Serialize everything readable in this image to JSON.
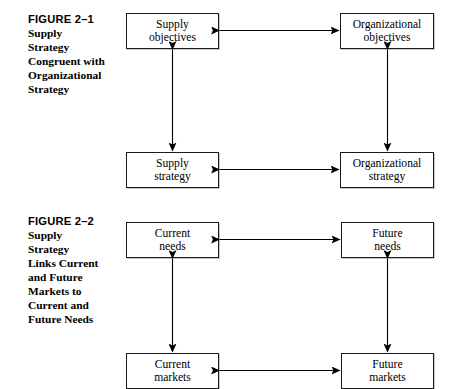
{
  "page": {
    "background": "#ffffff",
    "ink": "#000000",
    "width": 450,
    "height": 388
  },
  "figures": [
    {
      "id": "figure-2-1",
      "caption": {
        "title": "FIGURE 2–1",
        "lines": [
          "Supply",
          "Strategy",
          "Congruent with",
          "Organizational",
          "Strategy"
        ]
      },
      "nodes": [
        {
          "id": "supply-objectives",
          "lines": [
            "Supply",
            "objectives"
          ]
        },
        {
          "id": "organizational-objectives",
          "lines": [
            "Organizational",
            "objectives"
          ]
        },
        {
          "id": "supply-strategy",
          "lines": [
            "Supply",
            "strategy"
          ]
        },
        {
          "id": "organizational-strategy",
          "lines": [
            "Organizational",
            "strategy"
          ]
        }
      ],
      "connectors": [
        {
          "id": "supply-objectives-to-organizational-objectives",
          "kind": "double-headed-horizontal-arrow"
        },
        {
          "id": "supply-strategy-to-organizational-strategy",
          "kind": "double-headed-horizontal-arrow"
        },
        {
          "id": "supply-objectives-to-supply-strategy",
          "kind": "double-headed-vertical-arrow"
        },
        {
          "id": "organizational-objectives-to-organizational-strategy",
          "kind": "double-headed-vertical-arrow"
        }
      ]
    },
    {
      "id": "figure-2-2",
      "caption": {
        "title": "FIGURE 2–2",
        "lines": [
          "Supply",
          "Strategy",
          "Links Current",
          "and Future",
          "Markets to",
          "Current and",
          "Future Needs"
        ]
      },
      "nodes": [
        {
          "id": "current-needs",
          "lines": [
            "Current",
            "needs"
          ]
        },
        {
          "id": "future-needs",
          "lines": [
            "Future",
            "needs"
          ]
        },
        {
          "id": "current-markets",
          "lines": [
            "Current",
            "markets"
          ]
        },
        {
          "id": "future-markets",
          "lines": [
            "Future",
            "markets"
          ]
        }
      ],
      "connectors": [
        {
          "id": "current-needs-to-future-needs",
          "kind": "double-headed-horizontal-arrow"
        },
        {
          "id": "current-markets-to-future-markets",
          "kind": "double-headed-horizontal-arrow"
        },
        {
          "id": "current-needs-to-current-markets",
          "kind": "double-headed-vertical-arrow"
        },
        {
          "id": "future-needs-to-future-markets",
          "kind": "double-headed-vertical-arrow"
        }
      ]
    }
  ]
}
